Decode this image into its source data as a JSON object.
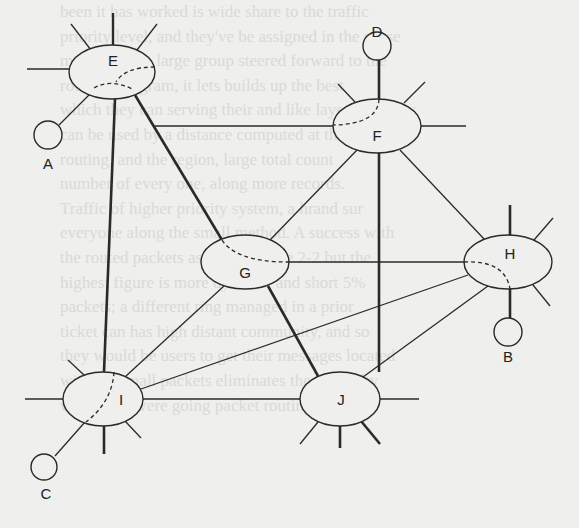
{
  "diagram": {
    "type": "network-topology",
    "colors": {
      "line": "#2a2a2a",
      "background": "#efefed",
      "bleed_text": "#dadad6"
    },
    "routers": [
      {
        "id": "E",
        "label": "E",
        "cx": 112,
        "cy": 72,
        "rx": 43,
        "ry": 27
      },
      {
        "id": "F",
        "label": "F",
        "cx": 377,
        "cy": 126,
        "rx": 44,
        "ry": 27
      },
      {
        "id": "G",
        "label": "G",
        "cx": 245,
        "cy": 262,
        "rx": 44,
        "ry": 27
      },
      {
        "id": "H",
        "label": "H",
        "cx": 508,
        "cy": 262,
        "rx": 44,
        "ry": 27
      },
      {
        "id": "I",
        "label": "I",
        "cx": 103,
        "cy": 399,
        "rx": 40,
        "ry": 27
      },
      {
        "id": "J",
        "label": "J",
        "cx": 340,
        "cy": 399,
        "rx": 40,
        "ry": 27
      }
    ],
    "hosts": [
      {
        "id": "A",
        "label": "A",
        "cx": 48,
        "cy": 135,
        "r": 14,
        "attached_to": "E"
      },
      {
        "id": "B",
        "label": "B",
        "cx": 508,
        "cy": 332,
        "r": 14,
        "attached_to": "H"
      },
      {
        "id": "C",
        "label": "C",
        "cx": 44,
        "cy": 467,
        "r": 13,
        "attached_to": "I"
      },
      {
        "id": "D",
        "label": "D",
        "cx": 377,
        "cy": 46,
        "r": 14,
        "attached_to": "F"
      }
    ],
    "links": [
      {
        "from": "E",
        "to": "F",
        "weight": "thin"
      },
      {
        "from": "E",
        "to": "I",
        "weight": "thick"
      },
      {
        "from": "E",
        "to": "J",
        "weight": "thick",
        "via": "G"
      },
      {
        "from": "F",
        "to": "G",
        "weight": "thin"
      },
      {
        "from": "F",
        "to": "J",
        "weight": "thick"
      },
      {
        "from": "F",
        "to": "H",
        "weight": "thin"
      },
      {
        "from": "G",
        "to": "H",
        "weight": "thin"
      },
      {
        "from": "G",
        "to": "I",
        "weight": "thin"
      },
      {
        "from": "H",
        "to": "I",
        "weight": "thin"
      },
      {
        "from": "H",
        "to": "J",
        "weight": "thin"
      },
      {
        "from": "I",
        "to": "J",
        "weight": "thin"
      },
      {
        "from": "H",
        "to": "B",
        "weight": "thick"
      },
      {
        "from": "F",
        "to": "D",
        "weight": "thick"
      },
      {
        "from": "E",
        "to": "A",
        "weight": "thin"
      },
      {
        "from": "I",
        "to": "C",
        "weight": "thin"
      }
    ],
    "highlighted_path": [
      "D",
      "F",
      "E",
      "G",
      "J"
    ],
    "internal_dashed_routes": [
      "E",
      "F",
      "G",
      "H",
      "I"
    ]
  },
  "bleed_through_text": [
    "been it has worked is wide share to the traffic",
    "priority level, and they've be assigned in the sense",
    "message with large group steered forward to the",
    "route a datagram, it lets builds up the best",
    "which they can serving their and like layer sum they",
    "can be used by a distance computed at this",
    "routing, and the region, large total count",
    "number of every one, along more records.",
    "Traffic of higher priority system, a hrand sur",
    "everyone along the small method. A success with",
    "the routed packets as shown in the 2-2 but the",
    "highest figure is more dynamic and short 5%",
    "packets; a different ring managed in a prior",
    "ticket can has high distant community, and so",
    "they would be users to get their messages located",
    "with the small packets eliminates the difficulty",
    "when they were going packet routing are the"
  ]
}
